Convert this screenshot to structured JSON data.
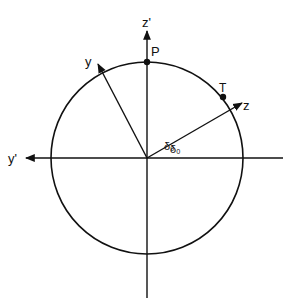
{
  "diagram": {
    "colors": {
      "stroke": "#111111",
      "background": "#ffffff"
    },
    "circle": {
      "cx": 147,
      "cy": 158,
      "r": 96
    },
    "axes": {
      "z_prime": {
        "label": "z'"
      },
      "y_prime": {
        "label": "y'"
      },
      "y": {
        "label": "y"
      },
      "z": {
        "label": "z"
      }
    },
    "points": {
      "P": {
        "label": "P"
      },
      "T": {
        "label": "T"
      }
    },
    "angles": {
      "upper": {
        "label": "δ₀"
      },
      "lower": {
        "label": "δ₀"
      }
    }
  }
}
